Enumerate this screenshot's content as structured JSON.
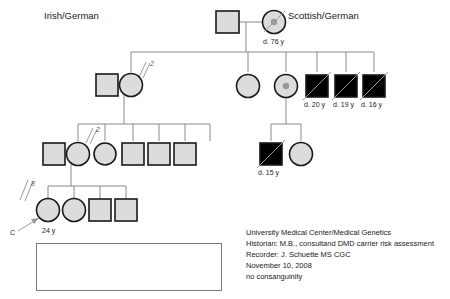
{
  "page": {
    "width": 450,
    "height": 299,
    "background": "#ffffff"
  },
  "ethnicity_labels": {
    "left": "Irish/German",
    "right": "Scottish/German"
  },
  "colors": {
    "affected": "#000000",
    "unaffected": "#dcdcdc",
    "outline": "#1a1a1a",
    "line": "#8a8a8a",
    "carrier_dot": "#9a9a9a",
    "text": "#1a1a1a"
  },
  "generations": {
    "I": {
      "individuals": [
        {
          "id": "I-1",
          "shape": "square",
          "status": "unaffected",
          "deceased": false,
          "carrier": false,
          "label": ""
        },
        {
          "id": "I-2",
          "shape": "circle",
          "status": "unaffected",
          "deceased": true,
          "carrier": true,
          "label": "d. 76 y"
        }
      ]
    },
    "II": {
      "individuals": [
        {
          "id": "II-1",
          "shape": "square",
          "status": "unaffected",
          "deceased": false,
          "carrier": false,
          "label": ""
        },
        {
          "id": "II-2",
          "shape": "circle",
          "status": "unaffected",
          "deceased": false,
          "carrier": false,
          "label": ""
        },
        {
          "id": "II-3",
          "shape": "circle",
          "status": "unaffected",
          "deceased": false,
          "carrier": false,
          "label": ""
        },
        {
          "id": "II-4",
          "shape": "circle",
          "status": "unaffected",
          "deceased": false,
          "carrier": true,
          "label": ""
        },
        {
          "id": "II-5",
          "shape": "square",
          "status": "affected",
          "deceased": true,
          "carrier": false,
          "label": "d. 20 y"
        },
        {
          "id": "II-6",
          "shape": "square",
          "status": "affected",
          "deceased": true,
          "carrier": false,
          "label": "d. 19 y"
        },
        {
          "id": "II-7",
          "shape": "square",
          "status": "affected",
          "deceased": true,
          "carrier": false,
          "label": "d. 16 y"
        }
      ],
      "sibship_count_mark": "2"
    },
    "III": {
      "individuals": [
        {
          "id": "III-1",
          "shape": "square",
          "status": "unaffected",
          "deceased": false,
          "carrier": false,
          "label": ""
        },
        {
          "id": "III-2",
          "shape": "circle",
          "status": "unaffected",
          "deceased": false,
          "carrier": false,
          "label": ""
        },
        {
          "id": "III-3",
          "shape": "circle",
          "status": "unaffected",
          "deceased": false,
          "carrier": false,
          "label": ""
        },
        {
          "id": "III-4",
          "shape": "square",
          "status": "unaffected",
          "deceased": false,
          "carrier": false,
          "label": ""
        },
        {
          "id": "III-5",
          "shape": "square",
          "status": "unaffected",
          "deceased": false,
          "carrier": false,
          "label": ""
        },
        {
          "id": "III-6",
          "shape": "square",
          "status": "unaffected",
          "deceased": false,
          "carrier": false,
          "label": ""
        },
        {
          "id": "III-7",
          "shape": "square",
          "status": "affected",
          "deceased": true,
          "carrier": false,
          "label": "d. 15 y"
        },
        {
          "id": "III-8",
          "shape": "circle",
          "status": "unaffected",
          "deceased": false,
          "carrier": false,
          "label": ""
        }
      ],
      "sibship_count_mark": "2"
    },
    "IV": {
      "individuals": [
        {
          "id": "IV-1",
          "shape": "circle",
          "status": "unaffected",
          "deceased": false,
          "carrier": false,
          "label": "24 y",
          "proband": true
        },
        {
          "id": "IV-2",
          "shape": "circle",
          "status": "unaffected",
          "deceased": false,
          "carrier": false,
          "label": ""
        },
        {
          "id": "IV-3",
          "shape": "square",
          "status": "unaffected",
          "deceased": false,
          "carrier": false,
          "label": ""
        },
        {
          "id": "IV-4",
          "shape": "square",
          "status": "unaffected",
          "deceased": false,
          "carrier": false,
          "label": ""
        }
      ],
      "sibship_count_mark": "8"
    }
  },
  "proband": {
    "marker": "C",
    "age_label": "24 y"
  },
  "key": {
    "title": "KEY:",
    "entries": [
      {
        "symbol": "filled-square",
        "label": "Duchenne muscular dystrophy"
      },
      {
        "symbol": "carrier-circle",
        "label": "Obligate DMD carrier"
      }
    ]
  },
  "notes": {
    "lines": [
      "University Medical Center/Medical Genetics",
      "Historian: M.B., consultand  DMD carrier risk assessment",
      "Recorder: J. Schuette MS CGC",
      "November 10, 2008",
      "no consanguinity"
    ]
  },
  "age_labels": {
    "i2": "d. 76 y",
    "ii5": "d. 20 y",
    "ii6": "d. 19 y",
    "ii7": "d. 16 y",
    "iii7": "d. 15 y",
    "iv1": "24 y"
  },
  "count_marks": {
    "gen2": "2",
    "gen3": "2",
    "gen4": "8"
  }
}
